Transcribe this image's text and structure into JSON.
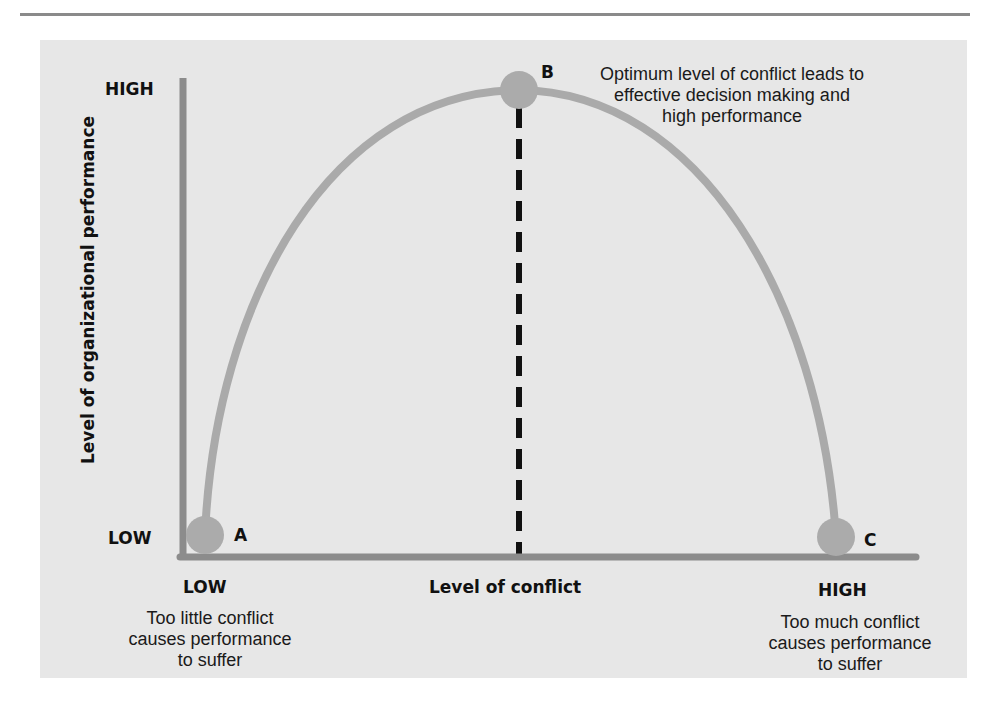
{
  "diagram": {
    "y_axis": {
      "label": "Level of organizational performance",
      "high_label": "HIGH",
      "low_label": "LOW"
    },
    "x_axis": {
      "label": "Level of conflict",
      "low_label": "LOW",
      "high_label": "HIGH"
    },
    "points": [
      {
        "id": "A",
        "label": "A",
        "conflict": "low",
        "performance": "low"
      },
      {
        "id": "B",
        "label": "B",
        "conflict": "moderate",
        "performance": "high"
      },
      {
        "id": "C",
        "label": "C",
        "conflict": "high",
        "performance": "low"
      }
    ],
    "annotations": {
      "optimum": [
        "Optimum level of conflict leads to",
        "effective decision making and",
        "high performance"
      ],
      "too_little": [
        "Too little conflict",
        "causes performance",
        "to suffer"
      ],
      "too_much": [
        "Too much conflict",
        "causes performance",
        "to suffer"
      ]
    },
    "colors": {
      "panel": "#e7e7e7",
      "axis": "#8c8c8c",
      "curve": "#aaaaaa",
      "point": "#ababab",
      "dashed": "#111111",
      "rule": "#8a8a8a"
    }
  }
}
